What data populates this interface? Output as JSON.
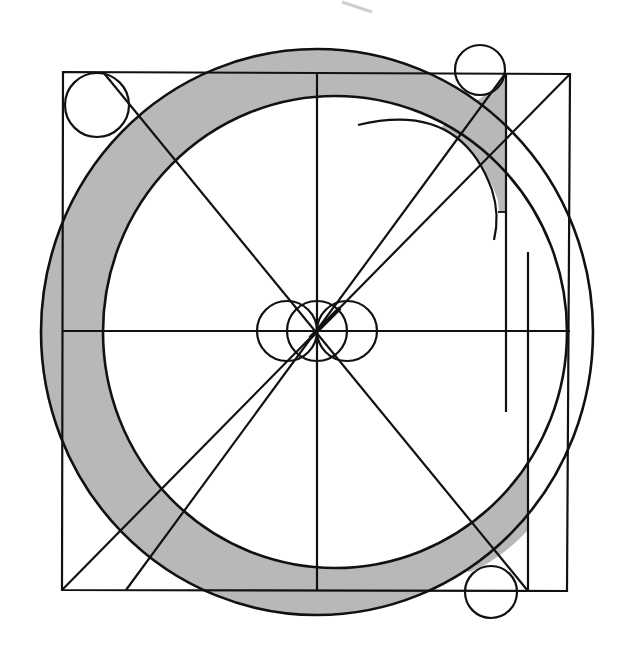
{
  "diagram": {
    "colors": {
      "stroke": "#111111",
      "fill_shade": "#b8b8b8",
      "background": "#ffffff",
      "smudge": "#d0d0d0"
    },
    "elements": [
      "bounding-square",
      "outer-bowl-circle",
      "inner-counter-circle",
      "shaded-letter-stroke",
      "vertical-axis",
      "horizontal-axis",
      "diagonal-main",
      "diagonal-cross",
      "diagonal-secondary",
      "center-circles",
      "corner-circles",
      "terminal-arc",
      "terminal-guide-lines"
    ]
  }
}
